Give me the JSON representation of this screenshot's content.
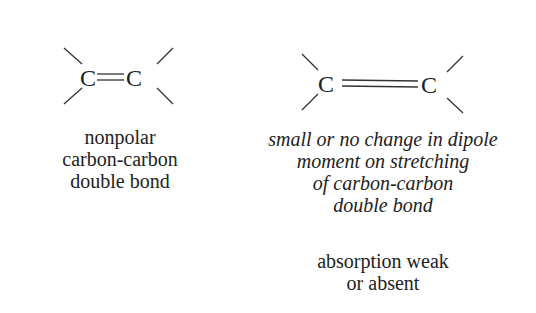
{
  "left": {
    "atom1": "C",
    "atom2": "C",
    "bond": "double",
    "caption": [
      "nonpolar",
      "carbon-carbon",
      "double bond"
    ]
  },
  "right": {
    "atom1": "C",
    "atom2": "C",
    "bond": "stretched double",
    "description": [
      "small or no change in dipole",
      "moment on stretching",
      "of carbon-carbon",
      "double bond"
    ],
    "result": [
      "absorption weak",
      "or absent"
    ]
  }
}
